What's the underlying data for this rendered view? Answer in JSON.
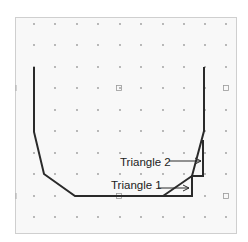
{
  "diagram": {
    "frame": {
      "x": 15,
      "y": 17,
      "width": 221,
      "height": 216,
      "background": "#f8f8f8",
      "border_color": "#cfcfcf"
    },
    "dot_grid": {
      "columns_x": [
        34,
        55,
        77,
        98,
        120,
        141,
        163,
        184,
        205,
        226
      ],
      "rows_y": [
        24,
        45,
        67,
        88,
        110,
        131,
        153,
        174,
        196,
        217
      ],
      "dot_color": "#9a9a9a",
      "square_markers": [
        [
          119,
          88
        ],
        [
          226,
          88
        ],
        [
          119,
          196
        ],
        [
          226,
          196
        ]
      ],
      "edge_ticks": [
        [
          16,
          88
        ],
        [
          16,
          196
        ]
      ]
    },
    "shape": {
      "stroke_color": "#2a2a2a",
      "outline_points": [
        [
          34,
          67
        ],
        [
          34,
          132
        ],
        [
          44,
          174
        ],
        [
          75,
          196
        ],
        [
          192,
          196
        ],
        [
          192,
          176
        ],
        [
          203,
          176
        ],
        [
          203,
          140
        ]
      ],
      "outer_path_points": [
        [
          204,
          67
        ],
        [
          204,
          131
        ],
        [
          192,
          176
        ],
        [
          163,
          196
        ]
      ]
    },
    "labels": [
      {
        "text": "Triangle 2",
        "x": 120,
        "y": 166,
        "arrow_from": [
          169,
          161
        ],
        "arrow_to": [
          201,
          161
        ]
      },
      {
        "text": "Triangle 1",
        "x": 111,
        "y": 189,
        "arrow_from": [
          158,
          188
        ],
        "arrow_to": [
          189,
          188
        ]
      }
    ]
  }
}
